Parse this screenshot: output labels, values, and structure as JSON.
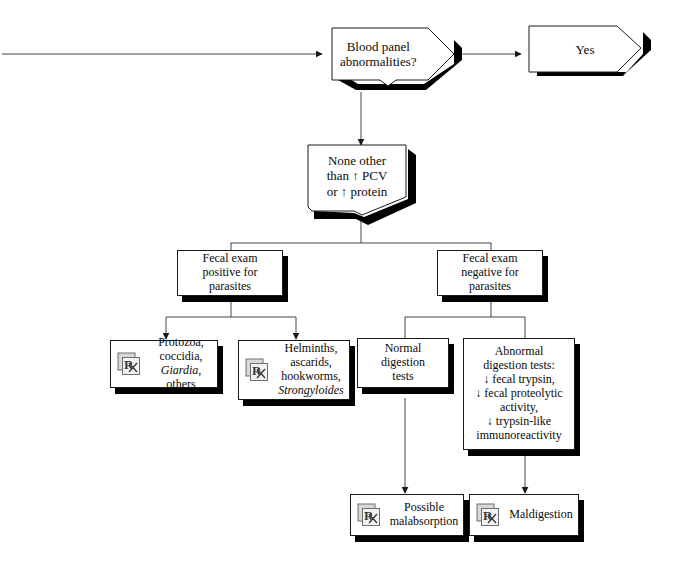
{
  "diagram": {
    "colors": {
      "line": "#1a1a1a",
      "shadow": "#000000",
      "fill": "#ffffff",
      "icon_gray": "#9a9a9a"
    },
    "nodes": {
      "blood_panel": {
        "label": "Blood panel\nabnormalities?",
        "shape": "decision-banner"
      },
      "yes": {
        "label": "Yes",
        "shape": "banner-right"
      },
      "none_other": {
        "label": "None other\nthan ↑ PCV\nor ↑ protein",
        "shape": "pentagon-down"
      },
      "fecal_positive": {
        "label": "Fecal exam\npositive for\nparasites",
        "shape": "box"
      },
      "fecal_negative": {
        "label": "Fecal exam\nnegative for\nparasites",
        "shape": "box"
      },
      "protozoa": {
        "label": "Protozoa,\ncoccidia,",
        "label_italic": "Giardia",
        "label_tail": ", others",
        "icon": "rx-icon",
        "shape": "box-rx"
      },
      "helminths": {
        "label": "Helminths,\nascarids,\nhookworms,",
        "label_italic": "Strongyloides",
        "icon": "rx-icon",
        "shape": "box-rx"
      },
      "normal_digestion": {
        "label": "Normal\ndigestion\ntests",
        "shape": "box"
      },
      "abnormal_digestion": {
        "label": "Abnormal\ndigestion tests:\n↓ fecal trypsin,\n↓ fecal proteolytic\nactivity,\n↓ trypsin-like\nimmunoreactivity",
        "shape": "box"
      },
      "malabsorption": {
        "label": "Possible\nmalabsorption",
        "icon": "rx-icon",
        "shape": "box-rx"
      },
      "maldigestion": {
        "label": "Maldigestion",
        "icon": "rx-icon",
        "shape": "box-rx"
      }
    },
    "edges": [
      {
        "from": "incoming",
        "to": "blood_panel",
        "arrow": true
      },
      {
        "from": "blood_panel",
        "to": "yes",
        "arrow": true
      },
      {
        "from": "blood_panel",
        "to": "none_other",
        "arrow": true
      },
      {
        "from": "none_other",
        "to": "fecal_positive",
        "arrow": false
      },
      {
        "from": "none_other",
        "to": "fecal_negative",
        "arrow": false
      },
      {
        "from": "fecal_positive",
        "to": "protozoa",
        "arrow": true
      },
      {
        "from": "fecal_positive",
        "to": "helminths",
        "arrow": true
      },
      {
        "from": "fecal_negative",
        "to": "normal_digestion",
        "arrow": false
      },
      {
        "from": "fecal_negative",
        "to": "abnormal_digestion",
        "arrow": false
      },
      {
        "from": "normal_digestion",
        "to": "malabsorption",
        "arrow": true
      },
      {
        "from": "abnormal_digestion",
        "to": "maldigestion",
        "arrow": true
      }
    ]
  }
}
